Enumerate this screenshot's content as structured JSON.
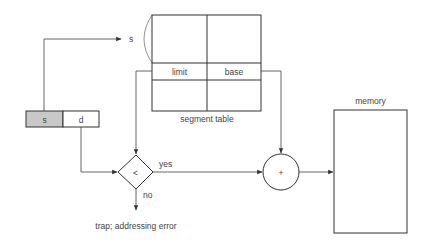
{
  "diagram": {
    "logical_address": {
      "segment_field": "s",
      "offset_field": "d",
      "segment_fill": "#c8c8c8"
    },
    "segment_index_label": "s",
    "segment_table": {
      "label": "segment table",
      "columns": [
        "limit",
        "base"
      ],
      "selected_row": {
        "limit": "limit",
        "base": "base"
      }
    },
    "comparator": {
      "symbol": "<",
      "yes_label": "yes",
      "no_label": "no"
    },
    "adder": {
      "symbol": "+"
    },
    "trap_label": "trap; addressing error",
    "memory": {
      "label": "memory"
    },
    "colors": {
      "line": "#333333",
      "background": "#ffffff",
      "segment_field_fill": "#c8c8c8"
    }
  }
}
